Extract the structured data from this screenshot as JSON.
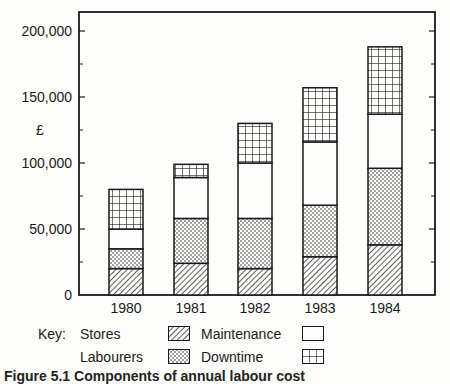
{
  "chart_data": {
    "type": "bar",
    "stacked": true,
    "title": "",
    "xlabel": "",
    "ylabel": "£",
    "ylim": [
      0,
      210000
    ],
    "yticks": [
      0,
      50000,
      100000,
      150000,
      200000
    ],
    "ytick_labels": [
      "0",
      "50,000",
      "100,000",
      "150,000",
      "200,000"
    ],
    "grid": false,
    "categories": [
      "1980",
      "1981",
      "1982",
      "1983",
      "1984"
    ],
    "series": [
      {
        "name": "Stores",
        "pattern": "diagonal-hatch",
        "values": [
          20000,
          24000,
          20000,
          29000,
          38000
        ]
      },
      {
        "name": "Labourers",
        "pattern": "dots",
        "values": [
          15000,
          34000,
          38000,
          39000,
          58000
        ]
      },
      {
        "name": "Maintenance",
        "pattern": "blank",
        "values": [
          15000,
          31000,
          42000,
          48000,
          41000
        ]
      },
      {
        "name": "Downtime",
        "pattern": "grid",
        "values": [
          30000,
          10000,
          30000,
          41000,
          51000
        ]
      }
    ],
    "totals": [
      80000,
      99000,
      130000,
      157000,
      188000
    ],
    "legend": {
      "position": "bottom",
      "title": "Key:"
    }
  },
  "legend": {
    "key_label": "Key:",
    "items": [
      {
        "label": "Stores"
      },
      {
        "label": "Maintenance"
      },
      {
        "label": "Labourers"
      },
      {
        "label": "Downtime"
      }
    ]
  },
  "caption": "Figure 5.1 Components of annual labour cost"
}
